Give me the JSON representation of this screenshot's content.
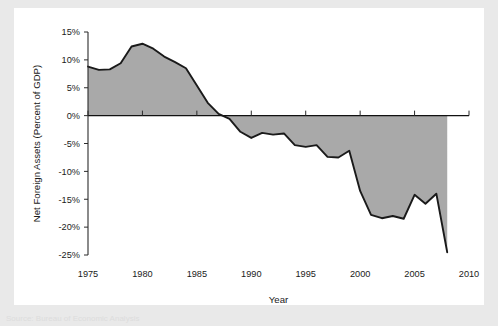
{
  "figure": {
    "background_color": "#ffffff",
    "page_color": "#e9e9e9",
    "area_fill_color": "#a9a9a9",
    "line_color": "#1a1a1a",
    "footnote": "Source: Bureau of Economic Analysis"
  },
  "chart_data": {
    "type": "area",
    "title": "",
    "subtitle": "",
    "xlabel": "Year",
    "ylabel": "Net Foreign Assets (Percent of GDP)",
    "xlim": [
      1975,
      2010
    ],
    "ylim": [
      -25,
      15
    ],
    "grid": false,
    "legend": false,
    "legend_position": "none",
    "x_tick_labels": [
      "1975",
      "1980",
      "1985",
      "1990",
      "1995",
      "2000",
      "2005",
      "2010"
    ],
    "x_ticks": [
      1975,
      1980,
      1985,
      1990,
      1995,
      2000,
      2005,
      2010
    ],
    "y_tick_labels": [
      "15%",
      "10%",
      "5%",
      "0%",
      "-5%",
      "-10%",
      "-15%",
      "-20%",
      "-25%"
    ],
    "y_ticks": [
      15,
      10,
      5,
      0,
      -5,
      -10,
      -15,
      -20,
      -25
    ],
    "series": [
      {
        "name": "Net Foreign Assets (Percent of GDP)",
        "x": [
          1975,
          1976,
          1977,
          1978,
          1979,
          1980,
          1981,
          1982,
          1983,
          1984,
          1985,
          1986,
          1987,
          1988,
          1989,
          1990,
          1991,
          1992,
          1993,
          1994,
          1995,
          1996,
          1997,
          1998,
          1999,
          2000,
          2001,
          2002,
          2003,
          2004,
          2005,
          2006,
          2007,
          2008
        ],
        "values": [
          8.8,
          8.2,
          8.3,
          9.4,
          12.4,
          12.9,
          12.0,
          10.6,
          9.6,
          8.5,
          5.4,
          2.3,
          0.3,
          -0.6,
          -2.9,
          -4.0,
          -3.1,
          -3.4,
          -3.2,
          -5.3,
          -5.6,
          -5.3,
          -7.4,
          -7.5,
          -6.3,
          -13.5,
          -17.8,
          -18.4,
          -18.0,
          -18.5,
          -14.2,
          -15.8,
          -14.0,
          -24.5
        ]
      }
    ]
  }
}
